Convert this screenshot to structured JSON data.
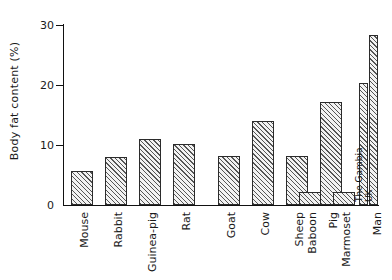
{
  "chart_data": {
    "type": "bar",
    "title": "",
    "xlabel": "",
    "ylabel": "Body fat content (%)",
    "ylim": [
      0,
      30
    ],
    "yticks": [
      0,
      10,
      20,
      30
    ],
    "ytick_labels": [
      "0",
      "10",
      "20",
      "30"
    ],
    "grid": false,
    "legend": false,
    "categories": [
      "Mouse",
      "Rabbit",
      "Guinea-pig",
      "Rat",
      "Goat",
      "Cow",
      "Sheep",
      "Pig",
      "Baboon",
      "Marmoset",
      "Man"
    ],
    "values": [
      5.7,
      8.0,
      11.0,
      10.2,
      8.1,
      14.0,
      8.1,
      17.1,
      2.2,
      2.2,
      null
    ],
    "bars": [
      {
        "label": "Mouse",
        "value": 5.7,
        "group": 1
      },
      {
        "label": "Rabbit",
        "value": 8.0,
        "group": 1
      },
      {
        "label": "Guinea-pig",
        "value": 11.0,
        "group": 1
      },
      {
        "label": "Rat",
        "value": 10.2,
        "group": 1
      },
      {
        "label": "Goat",
        "value": 8.1,
        "group": 2
      },
      {
        "label": "Cow",
        "value": 14.0,
        "group": 2
      },
      {
        "label": "Sheep",
        "value": 8.1,
        "group": 2
      },
      {
        "label": "Pig",
        "value": 17.1,
        "group": 2
      },
      {
        "label": "Baboon",
        "value": 2.2,
        "group": 3
      },
      {
        "label": "Marmoset",
        "value": 2.2,
        "group": 3
      },
      {
        "label": "Man (The Gambia)",
        "value": 20.3,
        "group": 3,
        "inline_label": "The Gambia"
      },
      {
        "label": "Man (UK)",
        "value": 28.4,
        "group": 3,
        "inline_label": "UK"
      }
    ],
    "annotations": [
      "The Gambia",
      "UK"
    ]
  },
  "axis": {
    "y_title": "Body fat content (%)",
    "ticks": [
      "30",
      "20",
      "10",
      "0"
    ]
  },
  "labels": {
    "mouse": "Mouse",
    "rabbit": "Rabbit",
    "guinea_pig": "Guinea-pig",
    "rat": "Rat",
    "goat": "Goat",
    "cow": "Cow",
    "sheep": "Sheep",
    "pig": "Pig",
    "baboon": "Baboon",
    "marmoset": "Marmoset",
    "man": "Man",
    "the_gambia": "The Gambia",
    "uk": "UK"
  }
}
